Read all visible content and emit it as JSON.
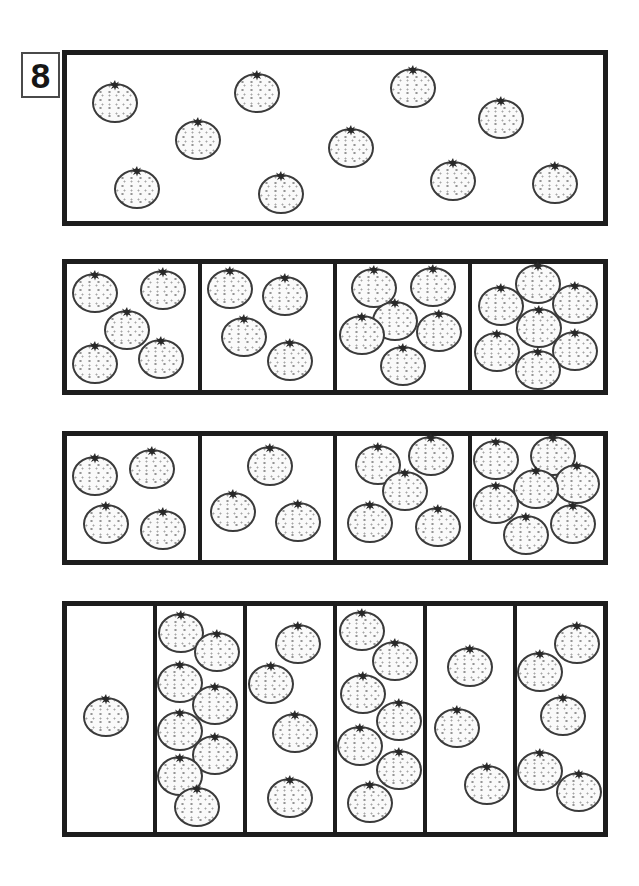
{
  "page": {
    "number_label": "8",
    "background": "#ffffff",
    "ink_color": "#1d1d1d"
  },
  "orange_style": {
    "fill": "#fafafa",
    "dot_color": "#949494",
    "outline": "#3a3a3a",
    "stem_color": "#282828",
    "width_px": 46,
    "height_px": 40
  },
  "sections": [
    {
      "name": "example-box",
      "left": 62,
      "top": 50,
      "width": 546,
      "height": 176,
      "cells": [
        {
          "count": 10,
          "oranges": [
            [
              9,
              29
            ],
            [
              35.5,
              23
            ],
            [
              64.5,
              20
            ],
            [
              81,
              38.5
            ],
            [
              24.5,
              51
            ],
            [
              53,
              56
            ],
            [
              13,
              81
            ],
            [
              40,
              84
            ],
            [
              72,
              76
            ],
            [
              91,
              77.5
            ]
          ]
        }
      ]
    },
    {
      "name": "choice-row-1",
      "left": 62,
      "top": 259,
      "width": 546,
      "height": 136,
      "cells": [
        {
          "count": 5,
          "oranges": [
            [
              21,
              23
            ],
            [
              73,
              21
            ],
            [
              46,
              52
            ],
            [
              21,
              79
            ],
            [
              72,
              75
            ]
          ]
        },
        {
          "count": 4,
          "oranges": [
            [
              21,
              20
            ],
            [
              63,
              25
            ],
            [
              32,
              58
            ],
            [
              67,
              77
            ]
          ]
        },
        {
          "count": 6,
          "oranges": [
            [
              28,
              19
            ],
            [
              73,
              18
            ],
            [
              44,
              45
            ],
            [
              19,
              56
            ],
            [
              78,
              54
            ],
            [
              50,
              81
            ]
          ]
        },
        {
          "count": 7,
          "oranges": [
            [
              50,
              16
            ],
            [
              22,
              33
            ],
            [
              79,
              32
            ],
            [
              51,
              51
            ],
            [
              19,
              70
            ],
            [
              79,
              69
            ],
            [
              50,
              84
            ]
          ]
        }
      ]
    },
    {
      "name": "choice-row-2",
      "left": 62,
      "top": 431,
      "width": 546,
      "height": 134,
      "cells": [
        {
          "count": 4,
          "oranges": [
            [
              21,
              32
            ],
            [
              65,
              27
            ],
            [
              30,
              71
            ],
            [
              73,
              76
            ]
          ]
        },
        {
          "count": 3,
          "oranges": [
            [
              52,
              24
            ],
            [
              24,
              61
            ],
            [
              73,
              69
            ]
          ]
        },
        {
          "count": 5,
          "oranges": [
            [
              31,
              23
            ],
            [
              72,
              16
            ],
            [
              52,
              44
            ],
            [
              25,
              70
            ],
            [
              77,
              73
            ]
          ]
        },
        {
          "count": 7,
          "oranges": [
            [
              18.5,
              19
            ],
            [
              62,
              16
            ],
            [
              80,
              39
            ],
            [
              49,
              43
            ],
            [
              18.5,
              55
            ],
            [
              41,
              80
            ],
            [
              77,
              71
            ]
          ]
        }
      ]
    },
    {
      "name": "choice-row-3",
      "left": 62,
      "top": 601,
      "width": 546,
      "height": 236,
      "cells": [
        {
          "count": 1,
          "oranges": [
            [
              45,
              49
            ]
          ]
        },
        {
          "count": 8,
          "oranges": [
            [
              28,
              12
            ],
            [
              70,
              20.5
            ],
            [
              27,
              34
            ],
            [
              68,
              44
            ],
            [
              27,
              55.5
            ],
            [
              68,
              66
            ],
            [
              27,
              75
            ],
            [
              47,
              89
            ]
          ]
        },
        {
          "count": 4,
          "oranges": [
            [
              59,
              17
            ],
            [
              28,
              34.5
            ],
            [
              56,
              56
            ],
            [
              50,
              85
            ]
          ]
        },
        {
          "count": 7,
          "oranges": [
            [
              29,
              11
            ],
            [
              67,
              24.5
            ],
            [
              30,
              39
            ],
            [
              72,
              51
            ],
            [
              27,
              62
            ],
            [
              72,
              72.5
            ],
            [
              38,
              87
            ]
          ]
        },
        {
          "count": 3,
          "oranges": [
            [
              50,
              27
            ],
            [
              35,
              54
            ],
            [
              70,
              79
            ]
          ]
        },
        {
          "count": 5,
          "oranges": [
            [
              70,
              17
            ],
            [
              27,
              29
            ],
            [
              53,
              48.5
            ],
            [
              27,
              73
            ],
            [
              72,
              82.5
            ]
          ]
        }
      ]
    }
  ]
}
